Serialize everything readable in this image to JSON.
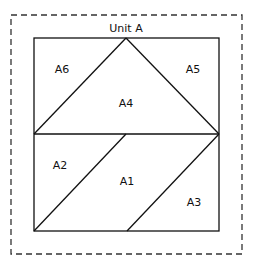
{
  "title": "Unit A",
  "pieces": [
    {
      "id": "A1",
      "label": "A1",
      "x": 126,
      "y": 183
    },
    {
      "id": "A2",
      "label": "A2",
      "x": 60,
      "y": 165
    },
    {
      "id": "A3",
      "label": "A3",
      "x": 193,
      "y": 205
    },
    {
      "id": "A4",
      "label": "A4",
      "x": 126,
      "y": 103
    },
    {
      "id": "A5",
      "label": "A5",
      "x": 193,
      "y": 69
    },
    {
      "id": "A6",
      "label": "A6",
      "x": 62,
      "y": 69
    }
  ],
  "colors": {
    "line": "#111111",
    "dash": "#333333",
    "background": "#ffffff"
  }
}
